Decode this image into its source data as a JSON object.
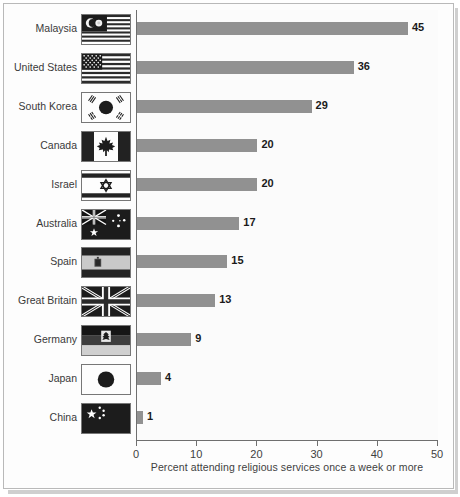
{
  "chart_data": {
    "type": "bar",
    "orientation": "horizontal",
    "title": "",
    "subtitle": "",
    "xlabel": "Percent attending religious services once a week or more",
    "ylabel": "",
    "xlim": [
      0,
      50
    ],
    "xticks": [
      0,
      10,
      20,
      30,
      40,
      50
    ],
    "xtick_labels": [
      "0",
      "10",
      "20",
      "30",
      "40",
      "50"
    ],
    "grid": false,
    "legend": false,
    "categories": [
      "Malaysia",
      "United States",
      "South Korea",
      "Canada",
      "Israel",
      "Australia",
      "Spain",
      "Great Britain",
      "Germany",
      "Japan",
      "China"
    ],
    "values": [
      45,
      36,
      29,
      20,
      20,
      17,
      15,
      13,
      9,
      4,
      1
    ],
    "data_labels": [
      "45",
      "36",
      "29",
      "20",
      "20",
      "17",
      "15",
      "13",
      "9",
      "4",
      "1"
    ],
    "series": [
      {
        "name": "Percent attending religious services once a week or more",
        "values": [
          45,
          36,
          29,
          20,
          20,
          17,
          15,
          13,
          9,
          4,
          1
        ]
      }
    ],
    "bar_color": "#919191",
    "background_color": "#fbfbfb",
    "axis_color": "#6f6f6f"
  },
  "rows": [
    {
      "label": "Malaysia",
      "value": 45,
      "value_label": "45",
      "flag": "flag-malaysia"
    },
    {
      "label": "United States",
      "value": 36,
      "value_label": "36",
      "flag": "flag-united-states"
    },
    {
      "label": "South Korea",
      "value": 29,
      "value_label": "29",
      "flag": "flag-south-korea"
    },
    {
      "label": "Canada",
      "value": 20,
      "value_label": "20",
      "flag": "flag-canada"
    },
    {
      "label": "Israel",
      "value": 20,
      "value_label": "20",
      "flag": "flag-israel"
    },
    {
      "label": "Australia",
      "value": 17,
      "value_label": "17",
      "flag": "flag-australia"
    },
    {
      "label": "Spain",
      "value": 15,
      "value_label": "15",
      "flag": "flag-spain"
    },
    {
      "label": "Great Britain",
      "value": 13,
      "value_label": "13",
      "flag": "flag-great-britain"
    },
    {
      "label": "Germany",
      "value": 9,
      "value_label": "9",
      "flag": "flag-germany"
    },
    {
      "label": "Japan",
      "value": 4,
      "value_label": "4",
      "flag": "flag-japan"
    },
    {
      "label": "China",
      "value": 1,
      "value_label": "1",
      "flag": "flag-china"
    }
  ],
  "axis": {
    "ticks": [
      "0",
      "10",
      "20",
      "30",
      "40",
      "50"
    ],
    "caption": "Percent attending religious services once a week or more"
  }
}
